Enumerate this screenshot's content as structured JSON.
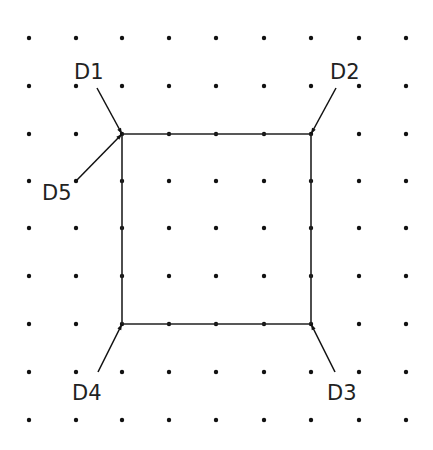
{
  "diagram": {
    "type": "cad-grid-rectangle",
    "grid": {
      "columns_x": [
        29,
        76,
        122,
        169,
        216,
        264,
        311,
        359,
        406
      ],
      "rows_y": [
        38,
        86,
        134,
        181,
        228,
        276,
        324,
        372,
        420
      ],
      "dot_color": "#111111"
    },
    "rectangle": {
      "corners": [
        [
          122,
          134
        ],
        [
          311,
          134
        ],
        [
          311,
          324
        ],
        [
          122,
          324
        ]
      ],
      "stroke": "#222222"
    },
    "pointers": [
      {
        "label": "D1",
        "label_x": 74,
        "label_y": 79,
        "from": [
          97,
          88
        ],
        "to": [
          122,
          134
        ]
      },
      {
        "label": "D2",
        "label_x": 330,
        "label_y": 79,
        "from": [
          336,
          88
        ],
        "to": [
          311,
          134
        ]
      },
      {
        "label": "D3",
        "label_x": 327,
        "label_y": 400,
        "from": [
          335,
          372
        ],
        "to": [
          311,
          324
        ]
      },
      {
        "label": "D4",
        "label_x": 72,
        "label_y": 400,
        "from": [
          98,
          372
        ],
        "to": [
          122,
          324
        ]
      },
      {
        "label": "D5",
        "label_x": 42,
        "label_y": 200,
        "from": [
          76,
          181
        ],
        "to": [
          122,
          134
        ]
      }
    ]
  }
}
